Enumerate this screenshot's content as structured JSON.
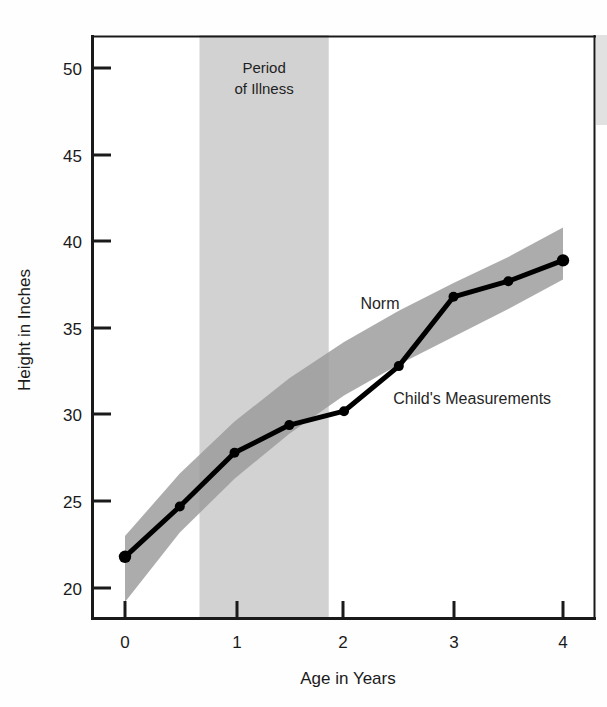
{
  "chart_data": {
    "type": "line",
    "title": "",
    "subtitle": "",
    "xlabel": "Age in Years",
    "ylabel": "Height in Inches",
    "xlim": [
      -0.15,
      4.3
    ],
    "ylim": [
      18.0,
      51.0
    ],
    "xticks": [
      0,
      1,
      2,
      3,
      4
    ],
    "xticklabels": [
      "0",
      "1",
      "2",
      "3",
      "4"
    ],
    "yticks": [
      20,
      25,
      30,
      35,
      40,
      45,
      50
    ],
    "yticklabels": [
      "20",
      "25",
      "30",
      "35",
      "40",
      "45",
      "50"
    ],
    "grid": false,
    "legend_position": "inline-annotations",
    "series": [
      {
        "name": "Child's Measurements",
        "type": "line-markers",
        "color": "#000000",
        "x": [
          0,
          0.5,
          1,
          1.5,
          2,
          2.5,
          3,
          3.5,
          4
        ],
        "values": [
          21.8,
          24.7,
          27.8,
          29.4,
          30.2,
          32.8,
          36.8,
          37.7,
          38.9
        ]
      },
      {
        "name": "Norm",
        "type": "band",
        "color": "#9a9a9a",
        "x": [
          0,
          0.5,
          1,
          1.5,
          2,
          2.5,
          3,
          3.5,
          4
        ],
        "upper": [
          23.0,
          26.6,
          29.6,
          32.1,
          34.2,
          36.0,
          37.6,
          39.1,
          40.8
        ],
        "lower": [
          19.2,
          23.2,
          26.3,
          28.9,
          31.1,
          32.9,
          34.5,
          36.1,
          37.8
        ]
      }
    ],
    "regions": [
      {
        "name": "Period of Illness",
        "type": "vspan",
        "x_start": 0.68,
        "x_end": 1.86,
        "color": "#d2d2d2",
        "label": "Period\nof Illness",
        "label_line1": "Period",
        "label_line2": "of Illness"
      }
    ],
    "annotations": [
      {
        "name": "norm-label",
        "text": "Norm",
        "x": 2.15,
        "y": 36.1
      },
      {
        "name": "child-label",
        "text": "Child's Measurements",
        "x": 2.45,
        "y": 30.6
      }
    ]
  },
  "axes": {
    "x_axis_title": "Age in Years",
    "y_axis_title": "Height in Inches"
  },
  "labels": {
    "illness_line1": "Period",
    "illness_line2": "of Illness",
    "norm": "Norm",
    "child": "Child's Measurements"
  },
  "colors": {
    "axis": "#1a1a1a",
    "line": "#000000",
    "norm_band": "#9a9a9a",
    "illness_band": "#d2d2d2",
    "background": "#ffffff"
  }
}
